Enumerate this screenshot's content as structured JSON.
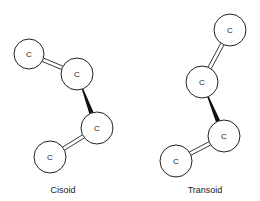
{
  "diagram": {
    "atom_symbol": "C",
    "molecules": [
      {
        "name": "Cisoid",
        "atoms": [
          {
            "symbol": "C",
            "x": 29,
            "y": 54,
            "r": 15
          },
          {
            "symbol": "C",
            "x": 77,
            "y": 74,
            "r": 16
          },
          {
            "symbol": "C",
            "x": 97,
            "y": 128,
            "r": 16
          },
          {
            "symbol": "C",
            "x": 50,
            "y": 157,
            "r": 16
          }
        ],
        "bonds": [
          {
            "from": 0,
            "to": 1,
            "type": "double"
          },
          {
            "from": 1,
            "to": 2,
            "type": "single-wedge"
          },
          {
            "from": 2,
            "to": 3,
            "type": "double"
          }
        ],
        "label": {
          "text": "Cisoid",
          "x": 63,
          "y": 193
        }
      },
      {
        "name": "Transoid",
        "atoms": [
          {
            "symbol": "C",
            "x": 230,
            "y": 30,
            "r": 16
          },
          {
            "symbol": "C",
            "x": 202,
            "y": 82,
            "r": 16
          },
          {
            "symbol": "C",
            "x": 224,
            "y": 136,
            "r": 16
          },
          {
            "symbol": "C",
            "x": 176,
            "y": 161,
            "r": 16
          }
        ],
        "bonds": [
          {
            "from": 0,
            "to": 1,
            "type": "double"
          },
          {
            "from": 1,
            "to": 2,
            "type": "single-wedge"
          },
          {
            "from": 2,
            "to": 3,
            "type": "double"
          }
        ],
        "label": {
          "text": "Transoid",
          "x": 205,
          "y": 193
        }
      }
    ]
  }
}
